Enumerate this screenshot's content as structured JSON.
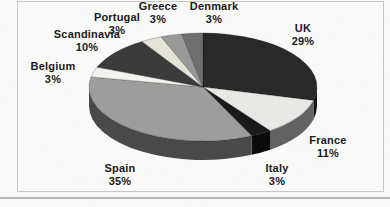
{
  "chart_data": {
    "type": "pie",
    "title": "",
    "style": "3d-pie-grayscale-scan",
    "direction": "clockwise",
    "start_angle_deg": 0,
    "unit": "%",
    "legend": "none",
    "categories": [
      "UK",
      "France",
      "Italy",
      "Spain",
      "Belgium",
      "Scandinavia",
      "Portugal",
      "Greece",
      "Denmark"
    ],
    "values": [
      29,
      11,
      3,
      35,
      3,
      10,
      3,
      3,
      3
    ],
    "colors": [
      "#262626",
      "#e9e9e5",
      "#161616",
      "#9d9d9b",
      "#f4f4f0",
      "#383838",
      "#e7e4d8",
      "#989896",
      "#6e6e6c"
    ],
    "side_colors": [
      "#101010",
      "#606060",
      "#070707",
      "#474747",
      "#9a9a9a",
      "#1d1d1d",
      "#8f8d84",
      "#5a5a5a",
      "#3c3c3c"
    ],
    "labels": [
      {
        "name": "UK",
        "value": "29%",
        "x": 303,
        "y": 22
      },
      {
        "name": "France",
        "value": "11%",
        "x": 328,
        "y": 134
      },
      {
        "name": "Italy",
        "value": "3%",
        "x": 277,
        "y": 162
      },
      {
        "name": "Spain",
        "value": "35%",
        "x": 120,
        "y": 162
      },
      {
        "name": "Belgium",
        "value": "3%",
        "x": 53,
        "y": 60
      },
      {
        "name": "Scandinavia",
        "value": "10%",
        "x": 87,
        "y": 28
      },
      {
        "name": "Portugal",
        "value": "3%",
        "x": 117,
        "y": 11
      },
      {
        "name": "Greece",
        "value": "3%",
        "x": 158,
        "y": 0
      },
      {
        "name": "Denmark",
        "value": "3%",
        "x": 214,
        "y": 0
      }
    ],
    "geometry": {
      "cx": 203,
      "cy": 87,
      "rx": 114,
      "ry": 54,
      "depth": 19
    },
    "background": "#fbfbf9",
    "frame_border": "#c7c7c5",
    "bottom_rule": "#aeacaa",
    "text_color": "#1a1a1a",
    "slice_outline": "rgba(0,0,0,0.45)"
  }
}
